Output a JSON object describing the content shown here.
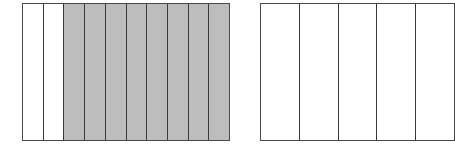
{
  "figure": {
    "shade_color": "#bdbdbd",
    "line_color": "#3a3a3a"
  },
  "left_rectangle": {
    "total_parts": 10,
    "shaded_parts": 8,
    "unshaded_parts": 2,
    "cells": [
      "plain",
      "plain",
      "shaded",
      "shaded",
      "shaded",
      "shaded",
      "shaded",
      "shaded",
      "shaded",
      "shaded"
    ]
  },
  "right_rectangle": {
    "visible_parts": 4,
    "shaded_parts": 0,
    "note_cropped": "extends beyond right edge",
    "cells": [
      "plain",
      "plain",
      "plain",
      "plain",
      "plain"
    ]
  }
}
